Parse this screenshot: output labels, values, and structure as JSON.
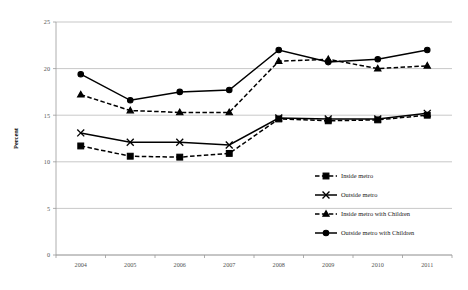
{
  "chart_data": {
    "type": "line",
    "title": "",
    "xlabel": "",
    "ylabel": "Percent",
    "categories": [
      "2004",
      "2005",
      "2006",
      "2007",
      "2008",
      "2009",
      "2010",
      "2011"
    ],
    "x": [
      2004,
      2005,
      2006,
      2007,
      2008,
      2009,
      2010,
      2011
    ],
    "ylim": [
      0,
      25
    ],
    "yticks": [
      0,
      5,
      10,
      15,
      20,
      25
    ],
    "ytick_labels": [
      "0",
      "5",
      "10",
      "15",
      "20",
      "25"
    ],
    "grid": true,
    "legend_position": "right-middle",
    "series": [
      {
        "name": "Inside metro",
        "marker": "square",
        "line_style": "dashed",
        "color": "#000000",
        "values": [
          11.7,
          10.6,
          10.5,
          10.9,
          14.6,
          14.4,
          14.5,
          15.0
        ]
      },
      {
        "name": "Outside metro",
        "marker": "x",
        "line_style": "solid",
        "color": "#000000",
        "values": [
          13.1,
          12.1,
          12.1,
          11.8,
          14.7,
          14.6,
          14.6,
          15.2
        ]
      },
      {
        "name": "Inside metro with Children",
        "marker": "triangle",
        "line_style": "dashed",
        "color": "#000000",
        "values": [
          17.2,
          15.5,
          15.3,
          15.3,
          20.8,
          21.0,
          20.0,
          20.3
        ]
      },
      {
        "name": "Outside metro with Children",
        "marker": "circle",
        "line_style": "solid",
        "color": "#000000",
        "values": [
          19.4,
          16.6,
          17.5,
          17.7,
          22.0,
          20.7,
          21.0,
          22.0
        ]
      }
    ]
  },
  "axis": {
    "y_title": "Percent",
    "y_ticks": [
      "0",
      "5",
      "10",
      "15",
      "20",
      "25"
    ],
    "x_ticks": [
      "2004",
      "2005",
      "2006",
      "2007",
      "2008",
      "2009",
      "2010",
      "2011"
    ]
  },
  "legend": {
    "items": [
      {
        "label": "Inside metro",
        "marker": "square",
        "style": "dashed"
      },
      {
        "label": "Outside metro",
        "marker": "x",
        "style": "solid"
      },
      {
        "label": "Inside metro with Children",
        "marker": "triangle",
        "style": "dashed"
      },
      {
        "label": "Outside metro with Children",
        "marker": "circle",
        "style": "solid"
      }
    ]
  }
}
